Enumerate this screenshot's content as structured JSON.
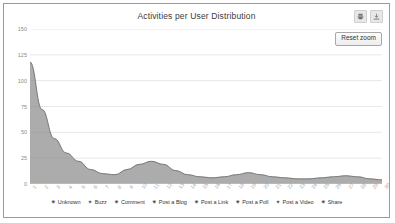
{
  "chart": {
    "title": "Activities per User Distribution",
    "reset_zoom_label": "Reset zoom",
    "export_icons": [
      {
        "name": "print-icon"
      },
      {
        "name": "download-icon"
      }
    ]
  },
  "chart_data": {
    "type": "area",
    "title": "Activities per User Distribution",
    "xlabel": "",
    "ylabel": "",
    "ylim": [
      0,
      150
    ],
    "yticks": [
      0,
      25,
      50,
      75,
      100,
      125,
      150
    ],
    "ytick_labels": [
      "0",
      "25",
      "50",
      "75",
      "100",
      "125",
      "150"
    ],
    "grid": true,
    "legend_position": "bottom",
    "x": [
      1,
      2,
      3,
      4,
      5,
      6,
      7,
      8,
      9,
      10,
      11,
      12,
      13,
      14,
      15,
      16,
      17,
      18,
      19,
      20,
      21,
      22,
      23,
      24,
      25,
      26,
      27,
      28,
      29,
      30
    ],
    "xtick_labels": [
      "1",
      "2",
      "3",
      "4",
      "5",
      "6",
      "7",
      "8",
      "9",
      "10",
      "11",
      "12",
      "13",
      "14",
      "15",
      "16",
      "17",
      "18",
      "19",
      "20",
      "21",
      "22",
      "23",
      "24",
      "25",
      "26",
      "27",
      "28",
      "29",
      "30"
    ],
    "values": [
      118,
      72,
      44,
      30,
      22,
      14,
      10,
      9,
      14,
      19,
      22,
      19,
      13,
      9,
      7,
      6,
      7,
      9,
      11,
      9,
      7,
      6,
      5,
      5,
      6,
      7,
      8,
      7,
      5,
      4
    ],
    "series": [
      {
        "name": "Unknown",
        "marker": "star",
        "color": "#4c4c4c"
      },
      {
        "name": "Buzz",
        "marker": "plus",
        "color": "#4c4c4c"
      },
      {
        "name": "Comment",
        "marker": "asterisk",
        "color": "#4c4c4c"
      },
      {
        "name": "Post a Blog",
        "marker": "star",
        "color": "#4c4c4c"
      },
      {
        "name": "Post a Link",
        "marker": "asterisk",
        "color": "#4c4c4c"
      },
      {
        "name": "Post a Poll",
        "marker": "asterisk",
        "color": "#4c4c4c"
      },
      {
        "name": "Post a Video",
        "marker": "plus",
        "color": "#4c4c4c"
      },
      {
        "name": "Share",
        "marker": "asterisk",
        "color": "#4c4c4c"
      }
    ],
    "area_fill": "#8c8c8c",
    "area_line": "#6b6b6b"
  }
}
